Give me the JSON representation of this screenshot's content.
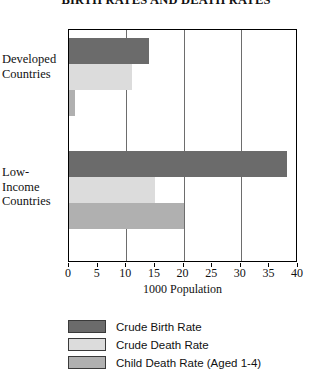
{
  "chart_data": {
    "type": "bar",
    "orientation": "horizontal",
    "title": "BIRTH RATES AND DEATH RATES",
    "xlabel": "1000 Population",
    "ylabel": "",
    "xlim": [
      0,
      40
    ],
    "xticks": [
      0,
      5,
      10,
      15,
      20,
      25,
      30,
      35,
      40
    ],
    "xtick_labels": [
      "0",
      "5",
      "10",
      "15",
      "20",
      "25",
      "30",
      "35",
      "40"
    ],
    "gridlines": [
      10,
      20,
      30
    ],
    "grid": true,
    "legend_position": "below",
    "categories": [
      "Developed Countries",
      "Low-Income Countries"
    ],
    "category_label_lines": [
      [
        "Developed",
        "Countries"
      ],
      [
        "Low-",
        "Income",
        "Countries"
      ]
    ],
    "series": [
      {
        "name": "Crude Birth Rate",
        "color": "#6b6b6b",
        "values": [
          14,
          38
        ]
      },
      {
        "name": "Crude Death Rate",
        "color": "#dcdcdc",
        "values": [
          11,
          15
        ]
      },
      {
        "name": "Child Death Rate (Aged 1-4)",
        "color": "#b0b0b0",
        "values": [
          1,
          20
        ]
      }
    ]
  },
  "legend": {
    "items": [
      {
        "label": "Crude Birth Rate"
      },
      {
        "label": "Crude Death Rate"
      },
      {
        "label": "Child Death Rate (Aged 1-4)"
      }
    ]
  }
}
